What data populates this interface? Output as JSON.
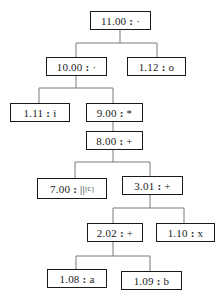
{
  "diagram": {
    "type": "tree",
    "edge_color": "#7a7a7a",
    "border_color": "#1a1a1a",
    "nodes": [
      {
        "id": "n11_00",
        "value": "11.00",
        "symbol": "·",
        "subscript": "",
        "parent": null
      },
      {
        "id": "n10_00",
        "value": "10.00",
        "symbol": "·",
        "subscript": "",
        "parent": "n11_00"
      },
      {
        "id": "n1_12",
        "value": "1.12",
        "symbol": "o",
        "subscript": "",
        "parent": "n11_00"
      },
      {
        "id": "n1_11",
        "value": "1.11",
        "symbol": "i",
        "subscript": "",
        "parent": "n10_00"
      },
      {
        "id": "n9_00",
        "value": "9.00",
        "symbol": "*",
        "subscript": "",
        "parent": "n10_00"
      },
      {
        "id": "n8_00",
        "value": "8.00",
        "symbol": "+",
        "subscript": "",
        "parent": "n9_00"
      },
      {
        "id": "n7_00",
        "value": "7.00",
        "symbol": "||",
        "subscript": "[C]",
        "parent": "n8_00"
      },
      {
        "id": "n3_01",
        "value": "3.01",
        "symbol": "+",
        "subscript": "",
        "parent": "n8_00"
      },
      {
        "id": "n2_02",
        "value": "2.02",
        "symbol": "+",
        "subscript": "",
        "parent": "n3_01"
      },
      {
        "id": "n1_10",
        "value": "1.10",
        "symbol": "x",
        "subscript": "",
        "parent": "n3_01"
      },
      {
        "id": "n1_08",
        "value": "1.08",
        "symbol": "a",
        "subscript": "",
        "parent": "n2_02"
      },
      {
        "id": "n1_09",
        "value": "1.09",
        "symbol": "b",
        "subscript": "",
        "parent": "n2_02"
      }
    ],
    "separator": ":"
  }
}
